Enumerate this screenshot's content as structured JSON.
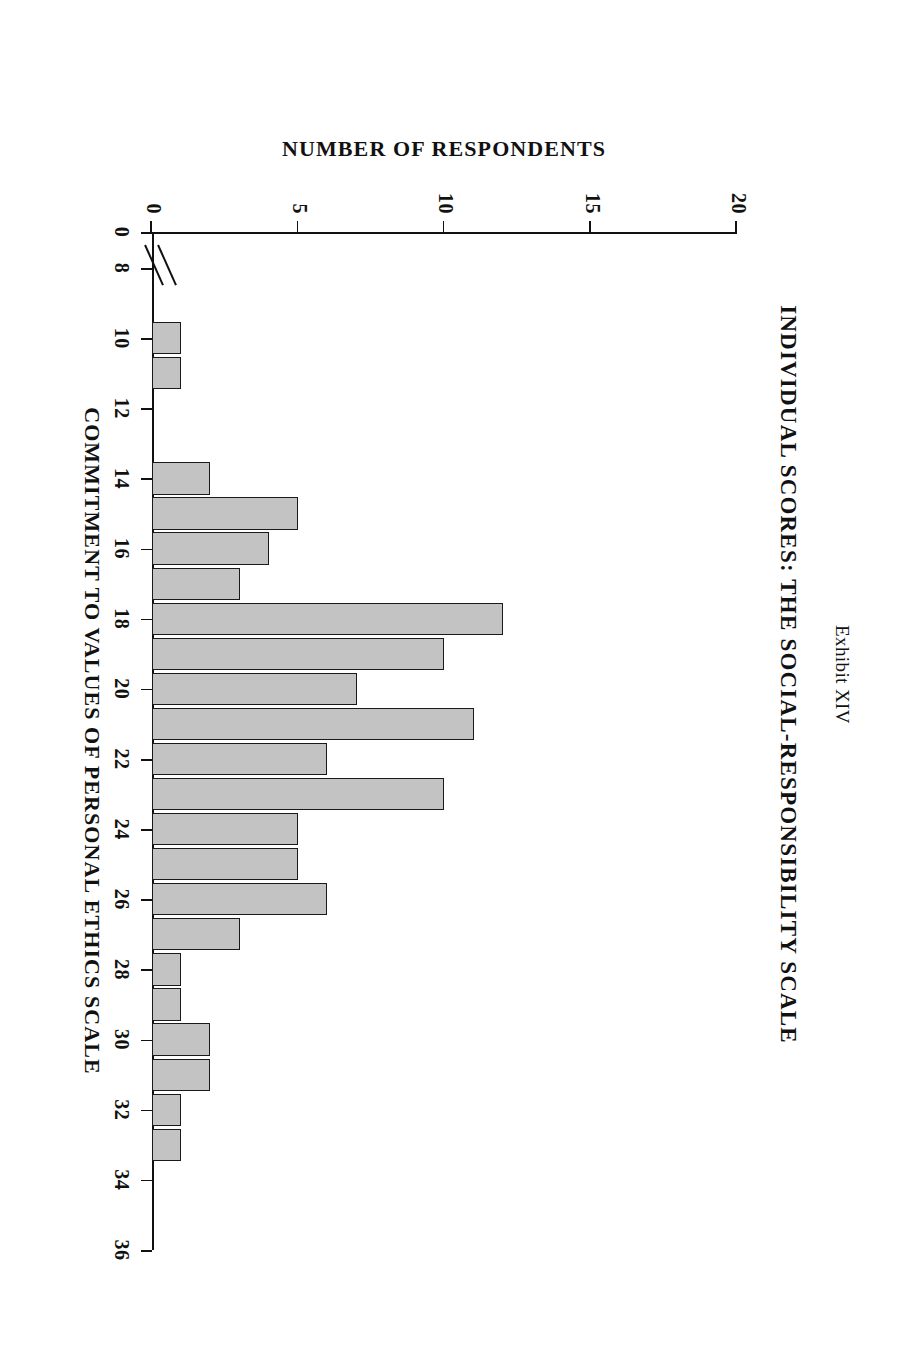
{
  "exhibit": {
    "number": "Exhibit XIV"
  },
  "chart_data": {
    "type": "bar",
    "orientation": "vertical",
    "title": "INDIVIDUAL SCORES:  THE SOCIAL-RESPONSIBILITY SCALE",
    "xlabel": "COMMITMENT TO VALUES OF PERSONAL ETHICS SCALE",
    "ylabel": "NUMBER OF RESPONDENTS",
    "grid": false,
    "legend": null,
    "xlim": [
      8,
      36
    ],
    "ylim": [
      0,
      20
    ],
    "x_axis_break": true,
    "x_break_note": "axis broken between 0 and 8",
    "xticks": [
      "0",
      "8",
      "10",
      "12",
      "14",
      "16",
      "18",
      "20",
      "22",
      "24",
      "26",
      "28",
      "30",
      "32",
      "34",
      "36"
    ],
    "yticks": [
      "0",
      "5",
      "10",
      "15",
      "20"
    ],
    "bar_fill_color": "#c3c3c3",
    "bar_edge_color": "#1a1a1a",
    "axis_color": "#111111",
    "categories": [
      10,
      11,
      14,
      15,
      16,
      17,
      18,
      19,
      20,
      21,
      22,
      23,
      24,
      25,
      26,
      27,
      28,
      29,
      30,
      31,
      32,
      33
    ],
    "values": [
      1,
      1,
      2,
      5,
      4,
      3,
      12,
      10,
      7,
      11,
      6,
      10,
      5,
      5,
      6,
      3,
      1,
      1,
      2,
      2,
      1,
      1
    ]
  }
}
